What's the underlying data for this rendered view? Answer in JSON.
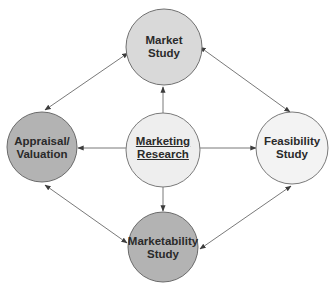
{
  "diagram": {
    "colors": {
      "stroke": "#6e6e6e",
      "arrow": "#555555",
      "text": "#2a2a2a",
      "light_fill": "#eeeeee",
      "medium_fill": "#d9d9d9",
      "dark_fill": "#b3b3b3",
      "feasibility_fill": "#f3f3f3"
    },
    "nodes": {
      "market_study": {
        "line1": "Market",
        "line2": "Study",
        "cx": 164,
        "cy": 47,
        "r": 38
      },
      "appraisal": {
        "line1": "Appraisal/",
        "line2": "Valuation",
        "cx": 42,
        "cy": 147,
        "r": 35
      },
      "marketing_research": {
        "line1": "Marketing",
        "line2": "Research",
        "cx": 163,
        "cy": 150,
        "r": 37
      },
      "feasibility_study": {
        "line1": "Feasibility",
        "line2": "Study",
        "cx": 292,
        "cy": 148,
        "r": 36
      },
      "marketability_study": {
        "line1": "Marketability",
        "line2": "Study",
        "cx": 163,
        "cy": 247,
        "r": 35
      }
    },
    "edges": [
      {
        "from": "Marketing Research",
        "to": "Market Study",
        "direction": "one-way"
      },
      {
        "from": "Marketing Research",
        "to": "Appraisal/Valuation",
        "direction": "one-way"
      },
      {
        "from": "Marketing Research",
        "to": "Feasibility Study",
        "direction": "one-way"
      },
      {
        "from": "Marketing Research",
        "to": "Marketability Study",
        "direction": "one-way"
      },
      {
        "from": "Market Study",
        "to": "Appraisal/Valuation",
        "direction": "two-way"
      },
      {
        "from": "Market Study",
        "to": "Feasibility Study",
        "direction": "two-way"
      },
      {
        "from": "Appraisal/Valuation",
        "to": "Marketability Study",
        "direction": "two-way"
      },
      {
        "from": "Feasibility Study",
        "to": "Marketability Study",
        "direction": "two-way"
      }
    ]
  }
}
